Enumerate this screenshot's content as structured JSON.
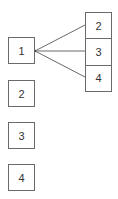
{
  "diagram": {
    "left_boxes": [
      {
        "label": "1"
      },
      {
        "label": "2"
      },
      {
        "label": "3"
      },
      {
        "label": "4"
      }
    ],
    "right_stack": [
      {
        "label": "2"
      },
      {
        "label": "3"
      },
      {
        "label": "4"
      }
    ],
    "connections": [
      {
        "from": "1",
        "to": "2"
      },
      {
        "from": "1",
        "to": "3"
      },
      {
        "from": "1",
        "to": "4"
      }
    ],
    "colors": {
      "stroke": "#6a6a6a",
      "text": "#333333",
      "background": "#ffffff"
    }
  }
}
